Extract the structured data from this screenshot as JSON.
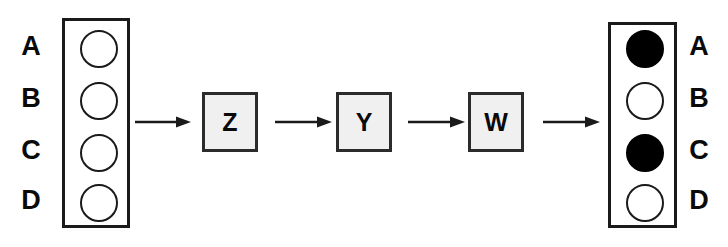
{
  "diagram": {
    "type": "flow-diagram",
    "background_color": "#ffffff",
    "line_color": "#1a1a1a",
    "box_fill_color": "#f0f0f0",
    "circle_filled_color": "#000000",
    "circle_empty_color": "#ffffff"
  },
  "left_panel": {
    "name": "input-column",
    "labels": [
      "A",
      "B",
      "C",
      "D"
    ],
    "circles": [
      {
        "label": "A",
        "state": "empty"
      },
      {
        "label": "B",
        "state": "empty"
      },
      {
        "label": "C",
        "state": "empty"
      },
      {
        "label": "D",
        "state": "empty"
      }
    ]
  },
  "right_panel": {
    "name": "output-column",
    "labels": [
      "A",
      "B",
      "C",
      "D"
    ],
    "circles": [
      {
        "label": "A",
        "state": "filled"
      },
      {
        "label": "B",
        "state": "empty"
      },
      {
        "label": "C",
        "state": "filled"
      },
      {
        "label": "D",
        "state": "empty"
      }
    ]
  },
  "process_boxes": [
    {
      "label": "Z"
    },
    {
      "label": "Y"
    },
    {
      "label": "W"
    }
  ],
  "arrows": [
    {
      "from": "input-column",
      "to": "Z",
      "direction": "right"
    },
    {
      "from": "Z",
      "to": "Y",
      "direction": "right"
    },
    {
      "from": "Y",
      "to": "W",
      "direction": "right"
    },
    {
      "from": "W",
      "to": "output-column",
      "direction": "right"
    }
  ]
}
